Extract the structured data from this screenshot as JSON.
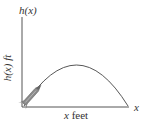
{
  "diagram": {
    "y_axis_top_label": "h(x)",
    "y_axis_side_label": "h(x) ft",
    "x_axis_end_label": "x",
    "x_axis_below_var": "x",
    "x_axis_below_unit": " feet",
    "curve": "parabolic trajectory",
    "object": "rocket-icon"
  }
}
